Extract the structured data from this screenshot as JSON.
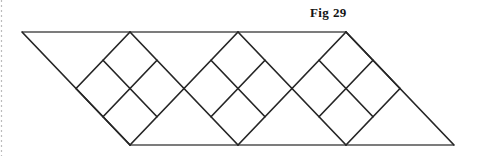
{
  "figure": {
    "label": "Fig 29"
  },
  "colors": {
    "background": "#ffffff",
    "diagonal_line": "#262626",
    "horizontal_line": "#515151",
    "page_edge_dots": "#bcbcbc",
    "label_text": "#141414"
  },
  "geometry": {
    "canvas_width": 483,
    "canvas_height": 156,
    "top_y": 32,
    "bottom_y": 145,
    "diamond_count": 3,
    "diamond_top_xs": [
      130,
      238,
      346
    ],
    "diamond_half_width": 54,
    "parallelogram": {
      "top_left_x": 22,
      "top_right_x": 346,
      "bottom_left_x": 130,
      "bottom_right_x": 454
    },
    "page_edge_x": 1.5
  }
}
